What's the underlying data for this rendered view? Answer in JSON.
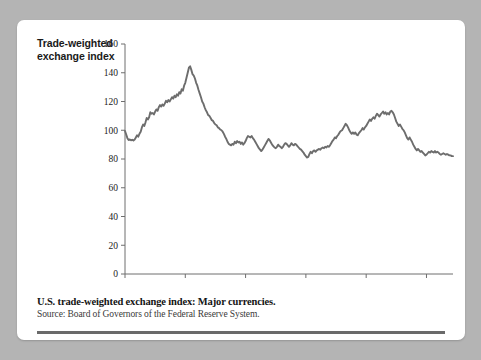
{
  "figure": {
    "y_axis_title_line1": "Trade-weighted",
    "y_axis_title_line2": "exchange index",
    "caption_title": "U.S. trade-weighted exchange index: Major currencies.",
    "caption_source": "Source: Board of Governors of the Federal Reserve System.",
    "line_color": "#6d6d6d",
    "axis_color": "#6e6e6e",
    "card_color": "#ffffff",
    "page_background": "#b4b4b4"
  },
  "chart_data": {
    "type": "line",
    "title": "U.S. trade-weighted exchange index: Major currencies.",
    "subtitle": "Source: Board of Governors of the Federal Reserve System.",
    "xlabel": "",
    "ylabel": "Trade-weighted exchange index",
    "xlim": [
      1980,
      2007.2
    ],
    "ylim": [
      0,
      160
    ],
    "ytick_values": [
      0,
      20,
      40,
      60,
      80,
      100,
      120,
      140,
      160
    ],
    "ytick_labels": [
      "0",
      "20",
      "40",
      "60",
      "80",
      "100",
      "120",
      "140",
      "160"
    ],
    "xtick_values": [
      1980,
      1985,
      1990,
      1995,
      2000,
      2005
    ],
    "xtick_labels": [
      "1980",
      "1985",
      "1990",
      "1995",
      "2000",
      "2005"
    ],
    "grid": false,
    "legend": false,
    "series": [
      {
        "name": "Trade-weighted exchange index",
        "x": [
          1980.0,
          1980.1,
          1980.2,
          1980.3,
          1980.4,
          1980.5,
          1980.6,
          1980.7,
          1980.8,
          1980.9,
          1981.0,
          1981.1,
          1981.2,
          1981.3,
          1981.4,
          1981.5,
          1981.6,
          1981.7,
          1981.8,
          1981.9,
          1982.0,
          1982.1,
          1982.2,
          1982.3,
          1982.4,
          1982.5,
          1982.6,
          1982.7,
          1982.8,
          1982.9,
          1983.0,
          1983.1,
          1983.2,
          1983.3,
          1983.4,
          1983.5,
          1983.6,
          1983.7,
          1983.8,
          1983.9,
          1984.0,
          1984.1,
          1984.2,
          1984.3,
          1984.4,
          1984.5,
          1984.6,
          1984.7,
          1984.8,
          1984.9,
          1985.0,
          1985.1,
          1985.2,
          1985.3,
          1985.4,
          1985.5,
          1985.6,
          1985.7,
          1985.8,
          1985.9,
          1986.0,
          1986.1,
          1986.2,
          1986.3,
          1986.4,
          1986.5,
          1986.6,
          1986.7,
          1986.8,
          1986.9,
          1987.0,
          1987.1,
          1987.2,
          1987.3,
          1987.4,
          1987.5,
          1987.6,
          1987.7,
          1987.8,
          1987.9,
          1988.0,
          1988.1,
          1988.2,
          1988.3,
          1988.4,
          1988.5,
          1988.6,
          1988.7,
          1988.8,
          1988.9,
          1989.0,
          1989.1,
          1989.2,
          1989.3,
          1989.4,
          1989.5,
          1989.6,
          1989.7,
          1989.8,
          1989.9,
          1990.0,
          1990.1,
          1990.2,
          1990.3,
          1990.4,
          1990.5,
          1990.6,
          1990.7,
          1990.8,
          1990.9,
          1991.0,
          1991.1,
          1991.2,
          1991.3,
          1991.4,
          1991.5,
          1991.6,
          1991.7,
          1991.8,
          1991.9,
          1992.0,
          1992.1,
          1992.2,
          1992.3,
          1992.4,
          1992.5,
          1992.6,
          1992.7,
          1992.8,
          1992.9,
          1993.0,
          1993.1,
          1993.2,
          1993.3,
          1993.4,
          1993.5,
          1993.6,
          1993.7,
          1993.8,
          1993.9,
          1994.0,
          1994.1,
          1994.2,
          1994.3,
          1994.4,
          1994.5,
          1994.6,
          1994.7,
          1994.8,
          1994.9,
          1995.0,
          1995.1,
          1995.2,
          1995.3,
          1995.4,
          1995.5,
          1995.6,
          1995.7,
          1995.8,
          1995.9,
          1996.0,
          1996.1,
          1996.2,
          1996.3,
          1996.4,
          1996.5,
          1996.6,
          1996.7,
          1996.8,
          1996.9,
          1997.0,
          1997.1,
          1997.2,
          1997.3,
          1997.4,
          1997.5,
          1997.6,
          1997.7,
          1997.8,
          1997.9,
          1998.0,
          1998.1,
          1998.2,
          1998.3,
          1998.4,
          1998.5,
          1998.6,
          1998.7,
          1998.8,
          1998.9,
          1999.0,
          1999.1,
          1999.2,
          1999.3,
          1999.4,
          1999.5,
          1999.6,
          1999.7,
          1999.8,
          1999.9,
          2000.0,
          2000.1,
          2000.2,
          2000.3,
          2000.4,
          2000.5,
          2000.6,
          2000.7,
          2000.8,
          2000.9,
          2001.0,
          2001.1,
          2001.2,
          2001.3,
          2001.4,
          2001.5,
          2001.6,
          2001.7,
          2001.8,
          2001.9,
          2002.0,
          2002.1,
          2002.2,
          2002.3,
          2002.4,
          2002.5,
          2002.6,
          2002.7,
          2002.8,
          2002.9,
          2003.0,
          2003.1,
          2003.2,
          2003.3,
          2003.4,
          2003.5,
          2003.6,
          2003.7,
          2003.8,
          2003.9,
          2004.0,
          2004.1,
          2004.2,
          2004.3,
          2004.4,
          2004.5,
          2004.6,
          2004.7,
          2004.8,
          2004.9,
          2005.0,
          2005.1,
          2005.2,
          2005.3,
          2005.4,
          2005.5,
          2005.6,
          2005.7,
          2005.8,
          2005.9,
          2006.0,
          2006.1,
          2006.2,
          2006.3,
          2006.4,
          2006.5,
          2006.6,
          2006.7,
          2006.8,
          2006.9,
          2007.0,
          2007.1,
          2007.2
        ],
        "values": [
          99.5,
          97.0,
          94.5,
          93.2,
          93.6,
          93.0,
          93.4,
          92.8,
          93.5,
          95.0,
          96.5,
          95.5,
          97.5,
          99.0,
          102.0,
          104.0,
          103.0,
          105.5,
          108.5,
          107.5,
          109.0,
          112.5,
          111.5,
          112.0,
          111.0,
          113.0,
          114.5,
          113.5,
          116.0,
          117.5,
          116.5,
          118.0,
          117.0,
          118.5,
          120.5,
          119.5,
          121.0,
          120.0,
          121.5,
          123.0,
          122.0,
          124.0,
          123.0,
          125.0,
          124.0,
          126.5,
          125.5,
          128.5,
          127.5,
          131.0,
          133.0,
          136.5,
          140.0,
          143.5,
          144.5,
          142.0,
          139.0,
          138.0,
          136.0,
          133.0,
          131.0,
          128.0,
          125.5,
          123.0,
          120.0,
          118.5,
          116.0,
          114.0,
          112.5,
          110.5,
          110.0,
          108.5,
          107.0,
          106.5,
          105.0,
          104.0,
          103.5,
          102.0,
          101.5,
          100.5,
          100.0,
          99.0,
          97.5,
          95.5,
          94.0,
          92.0,
          90.5,
          90.0,
          89.5,
          90.5,
          90.0,
          92.0,
          91.0,
          92.5,
          91.5,
          92.0,
          90.5,
          91.5,
          90.0,
          91.0,
          92.5,
          94.5,
          96.0,
          95.5,
          95.0,
          96.0,
          94.5,
          93.5,
          92.0,
          90.5,
          89.0,
          87.5,
          86.5,
          85.5,
          86.5,
          88.0,
          89.5,
          91.0,
          92.5,
          94.0,
          93.0,
          91.5,
          90.0,
          89.0,
          88.0,
          87.5,
          88.5,
          90.0,
          89.0,
          88.5,
          87.5,
          88.5,
          90.0,
          91.0,
          90.5,
          89.5,
          88.5,
          89.5,
          91.0,
          90.0,
          89.5,
          90.5,
          90.0,
          89.0,
          88.0,
          87.0,
          86.5,
          85.5,
          84.5,
          83.0,
          82.0,
          81.0,
          81.5,
          83.5,
          85.0,
          84.0,
          85.5,
          86.0,
          85.0,
          86.0,
          86.5,
          87.0,
          86.5,
          87.5,
          88.0,
          87.5,
          88.5,
          88.0,
          89.0,
          88.5,
          89.5,
          91.0,
          92.5,
          93.5,
          95.0,
          94.5,
          96.0,
          97.0,
          98.5,
          99.5,
          100.0,
          101.5,
          103.0,
          104.5,
          103.5,
          102.0,
          100.0,
          98.5,
          97.5,
          98.5,
          97.5,
          98.5,
          97.0,
          96.5,
          98.0,
          99.0,
          100.0,
          101.5,
          100.5,
          102.0,
          103.0,
          104.5,
          106.0,
          107.5,
          106.5,
          108.0,
          109.0,
          108.0,
          110.0,
          111.5,
          110.5,
          109.5,
          111.0,
          112.0,
          113.0,
          111.5,
          112.5,
          111.0,
          112.0,
          111.0,
          113.0,
          113.5,
          112.5,
          111.0,
          108.5,
          106.0,
          104.5,
          103.0,
          104.0,
          102.5,
          101.0,
          100.0,
          98.5,
          96.5,
          94.5,
          93.5,
          95.0,
          93.5,
          92.0,
          90.0,
          88.5,
          87.0,
          86.0,
          87.0,
          86.0,
          85.0,
          85.5,
          84.5,
          83.5,
          82.5,
          83.0,
          84.0,
          85.0,
          84.5,
          85.5,
          85.0,
          84.5,
          85.5,
          84.5,
          85.0,
          84.5,
          83.5,
          83.0,
          83.5,
          84.0,
          83.5,
          83.0,
          83.5,
          83.0,
          82.5,
          82.5,
          82.0,
          82.0
        ]
      }
    ]
  }
}
